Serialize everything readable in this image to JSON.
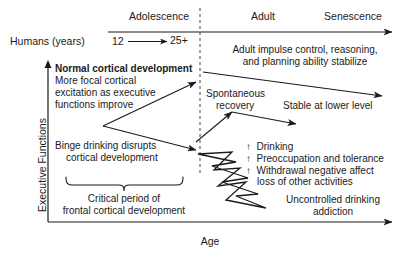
{
  "figure": {
    "type": "conceptual-diagram",
    "axes": {
      "x_label": "Age",
      "y_label": "Executive Functions"
    },
    "timeline": {
      "row_label": "Humans (years)",
      "stages": [
        {
          "name": "Adolescence"
        },
        {
          "name": "Adult"
        },
        {
          "name": "Senescence"
        }
      ],
      "range_start": "12",
      "range_end": "25+"
    },
    "annotations": {
      "adult_stabilize": {
        "line1": "Adult impulse control, reasoning,",
        "line2": "and planning ability stabilize"
      },
      "normal_development": {
        "heading": "Normal cortical development",
        "line1": "More focal cortical",
        "line2": "excitation as executive",
        "line3": "functions improve"
      },
      "spontaneous_recovery": {
        "line1": "Spontaneous",
        "line2": "recovery"
      },
      "stable_lower": "Stable at lower level",
      "binge_drinking": {
        "line1": "Binge drinking disrupts",
        "line2": "cortical development"
      },
      "critical_period": {
        "line1": "Critical period of",
        "line2": "frontal cortical development"
      },
      "escalation_list": [
        "↑  Drinking",
        "↑  Preoccupation and tolerance",
        "↑  Withdrawal negative affect",
        "    loss of other activities"
      ],
      "uncontrolled": {
        "line1": "Uncontrolled drinking",
        "line2": "addiction"
      }
    },
    "colors": {
      "ink": "#1a1a1a",
      "background": "#ffffff"
    }
  }
}
